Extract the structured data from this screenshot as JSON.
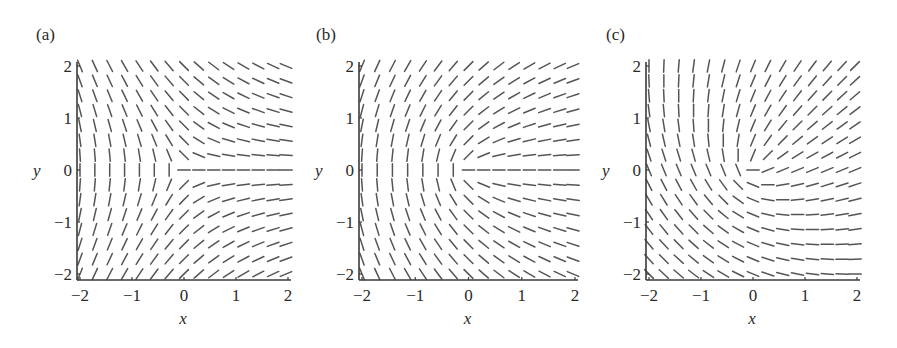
{
  "chart_data": [
    {
      "type": "slope_field",
      "panel_label": "(a)",
      "title": "",
      "xlabel": "x",
      "ylabel": "y",
      "xlim": [
        -2,
        2
      ],
      "ylim": [
        -2,
        2
      ],
      "xticks": [
        -2,
        -1,
        0,
        1,
        2
      ],
      "yticks": [
        -2,
        -1,
        0,
        1,
        2
      ],
      "xtick_labels": [
        "−2",
        "−1",
        "0",
        "1",
        "2"
      ],
      "ytick_labels": [
        "−2",
        "−1",
        "0",
        "1",
        "2"
      ],
      "grid": false,
      "legend": null,
      "field": {
        "grid_points_x": 15,
        "grid_points_y": 15,
        "description": "slope dy/dx = -y/(x+sqrt(x^2+y^2)); segment angle = -atan2(y,x)/2",
        "angle_rule": "-phi/2",
        "offset_deg": 0
      },
      "frame": {
        "axis_x_px": 77,
        "x_min_px": 80,
        "x_max_px": 288,
        "y_max_px": 66,
        "y_min_px": 274,
        "axis_bottom_px": 280,
        "label_x_px": 36,
        "label_y_px": 40
      }
    },
    {
      "type": "slope_field",
      "panel_label": "(b)",
      "title": "",
      "xlabel": "x",
      "ylabel": "y",
      "xlim": [
        -2,
        2
      ],
      "ylim": [
        -2,
        2
      ],
      "xticks": [
        -2,
        -1,
        0,
        1,
        2
      ],
      "yticks": [
        -2,
        -1,
        0,
        1,
        2
      ],
      "xtick_labels": [
        "−2",
        "−1",
        "0",
        "1",
        "2"
      ],
      "ytick_labels": [
        "−2",
        "−1",
        "0",
        "1",
        "2"
      ],
      "grid": false,
      "legend": null,
      "field": {
        "grid_points_x": 15,
        "grid_points_y": 15,
        "description": "slope dy/dx = y/(x+sqrt(x^2+y^2)); segment angle = atan2(y,x)/2",
        "angle_rule": "phi/2",
        "offset_deg": 0
      },
      "frame": {
        "axis_x_px": 359,
        "x_min_px": 362,
        "x_max_px": 575,
        "y_max_px": 66,
        "y_min_px": 274,
        "axis_bottom_px": 280,
        "label_x_px": 316,
        "label_y_px": 40
      }
    },
    {
      "type": "slope_field",
      "panel_label": "(c)",
      "title": "",
      "xlabel": "x",
      "ylabel": "y",
      "xlim": [
        -2,
        2
      ],
      "ylim": [
        -2,
        2
      ],
      "xticks": [
        -2,
        -1,
        0,
        1,
        2
      ],
      "yticks": [
        -2,
        -1,
        0,
        1,
        2
      ],
      "xtick_labels": [
        "−2",
        "−1",
        "0",
        "1",
        "2"
      ],
      "ytick_labels": [
        "−2",
        "−1",
        "0",
        "1",
        "2"
      ],
      "grid": false,
      "legend": null,
      "field": {
        "grid_points_x": 15,
        "grid_points_y": 15,
        "description": "segment angle = atan2(y,x)/2 + 22.5 deg (rotated variant of b)",
        "angle_rule": "phi/2",
        "offset_deg": 22.5
      },
      "frame": {
        "axis_x_px": 646,
        "x_min_px": 649,
        "x_max_px": 857,
        "y_max_px": 66,
        "y_min_px": 274,
        "axis_bottom_px": 280,
        "label_x_px": 606,
        "label_y_px": 40
      }
    }
  ]
}
